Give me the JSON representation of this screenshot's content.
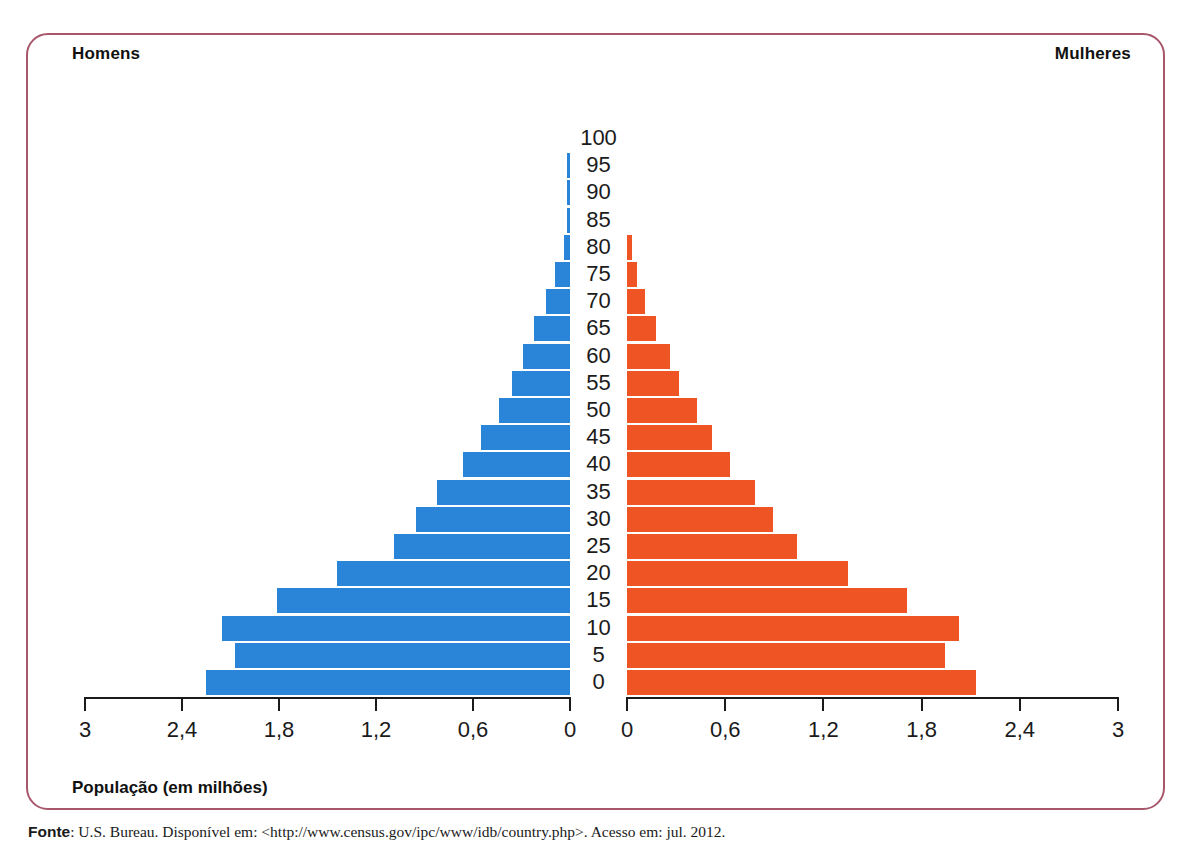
{
  "header": {
    "left_label": "Homens",
    "right_label": "Mulheres"
  },
  "axis_title": "População (em milhões)",
  "source": {
    "prefix": "Fonte",
    "text": ": U.S. Bureau. Disponível em: <http://www.census.gov/ipc/www/idb/country.php>. Acesso em: jul. 2012."
  },
  "chart_data": {
    "type": "bar",
    "subtype": "population-pyramid",
    "title": "",
    "xlabel": "População (em milhões)",
    "ylabel": "",
    "xlim": [
      0,
      3
    ],
    "xticks": [
      "0",
      "0,6",
      "1,2",
      "1,8",
      "2,4",
      "3"
    ],
    "xtick_values": [
      0,
      0.6,
      1.2,
      1.8,
      2.4,
      3
    ],
    "left_axis_ticks": [
      "3",
      "2,4",
      "1,8",
      "1,2",
      "0,6",
      "0"
    ],
    "right_axis_ticks": [
      "0",
      "0,6",
      "1,2",
      "1,8",
      "2,4",
      "3"
    ],
    "grid": false,
    "legend_position": "top",
    "categories": [
      "0",
      "5",
      "10",
      "15",
      "20",
      "25",
      "30",
      "35",
      "40",
      "45",
      "50",
      "55",
      "60",
      "65",
      "70",
      "75",
      "80",
      "85",
      "90",
      "95",
      "100"
    ],
    "series": [
      {
        "name": "Homens",
        "color": "#2a85d8",
        "side": "left",
        "values": [
          2.25,
          2.07,
          2.15,
          1.81,
          1.44,
          1.09,
          0.95,
          0.82,
          0.66,
          0.55,
          0.44,
          0.36,
          0.29,
          0.22,
          0.15,
          0.09,
          0.04,
          0.02,
          0.012,
          0.008,
          0.0
        ]
      },
      {
        "name": "Mulheres",
        "color": "#ef5425",
        "side": "right",
        "values": [
          2.13,
          1.94,
          2.03,
          1.71,
          1.35,
          1.04,
          0.89,
          0.78,
          0.63,
          0.52,
          0.43,
          0.32,
          0.26,
          0.18,
          0.11,
          0.06,
          0.03,
          0.0,
          0.0,
          0.0,
          0.0
        ]
      }
    ]
  }
}
